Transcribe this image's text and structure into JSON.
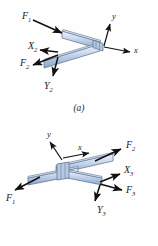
{
  "figure": {
    "background": "#fefefe",
    "bar_fill_light": "#e8eef7",
    "bar_fill_mid": "#b9cbe4",
    "bar_fill_dark": "#8ea8c9",
    "bar_edge": "#5a6f8c",
    "arrow_color": "#111111"
  },
  "panels": [
    {
      "id": "a",
      "caption": "(a)",
      "description": "Two bars meeting at a joint forming a V opening to the left",
      "axes": [
        {
          "name": "y-axis",
          "label": "y"
        },
        {
          "name": "x-axis",
          "label": "x"
        }
      ],
      "forces": [
        {
          "name": "F1",
          "base": "F",
          "sub": "1",
          "direction": "down-right"
        },
        {
          "name": "X2",
          "base": "X",
          "sub": "2",
          "direction": "left"
        },
        {
          "name": "F2",
          "base": "F",
          "sub": "2",
          "direction": "down-left"
        },
        {
          "name": "Y2",
          "base": "Y",
          "sub": "2",
          "direction": "down"
        }
      ]
    },
    {
      "id": "b",
      "caption": "(b)",
      "description": "Two bars crossing at a joint forming a shallow X",
      "axes": [
        {
          "name": "y-axis",
          "label": "y"
        },
        {
          "name": "x-axis",
          "label": "x"
        }
      ],
      "forces": [
        {
          "name": "F1",
          "base": "F",
          "sub": "1",
          "direction": "down-left"
        },
        {
          "name": "F2",
          "base": "F",
          "sub": "2",
          "direction": "up-right"
        },
        {
          "name": "X3",
          "base": "X",
          "sub": "3",
          "direction": "right-up"
        },
        {
          "name": "F3",
          "base": "F",
          "sub": "3",
          "direction": "right-down"
        },
        {
          "name": "Y3",
          "base": "Y",
          "sub": "3",
          "direction": "down"
        }
      ]
    }
  ]
}
